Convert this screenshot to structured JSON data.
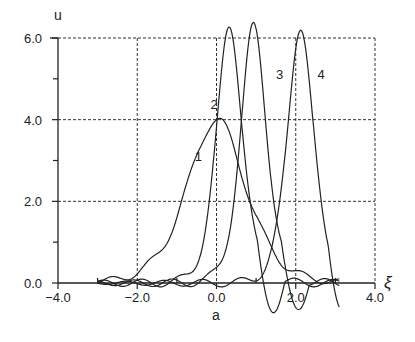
{
  "chart_data": {
    "type": "line",
    "title": "",
    "xlabel": "a",
    "xlabel_right": "ξ",
    "ylabel": "u",
    "xlim": [
      -4.0,
      4.0
    ],
    "ylim": [
      0.0,
      6.0
    ],
    "x_ticks": [
      -4.0,
      -2.0,
      0.0,
      2.0,
      4.0
    ],
    "x_tick_labels": [
      "-4.0",
      "-2.0",
      "0.0",
      "2.0",
      "4.0"
    ],
    "y_ticks": [
      0.0,
      2.0,
      4.0,
      6.0
    ],
    "y_tick_labels": [
      "0.0",
      "2.0",
      "4.0",
      "6.0"
    ],
    "grid": true,
    "grid_style": "dashed",
    "legend": "inline curve numbers",
    "series": [
      {
        "name": "1",
        "label": "1",
        "shape": "sech2",
        "amplitude": 4.0,
        "center": 0.0,
        "k": 1.02,
        "description": "broad soliton, peak u=4.0 at a=0",
        "label_pos": [
          -0.55,
          3.0
        ]
      },
      {
        "name": "2",
        "label": "2",
        "shape": "sech2",
        "amplitude": 6.3,
        "center": 0.33,
        "k": 2.3,
        "description": "narrow peak u≈6.3 at a≈0.33",
        "label_pos": [
          -0.15,
          4.25
        ]
      },
      {
        "name": "3",
        "label": "3",
        "shape": "sech2",
        "amplitude": 6.3,
        "center": 0.94,
        "k": 2.3,
        "description": "narrow peak u≈6.3 at a≈0.94",
        "label_pos": [
          1.5,
          5.0
        ]
      },
      {
        "name": "4",
        "label": "4",
        "shape": "sech2",
        "amplitude": 6.3,
        "center": 2.12,
        "k": 2.3,
        "description": "narrow peak u≈6.3 at a≈2.12",
        "label_pos": [
          2.55,
          5.0
        ]
      }
    ],
    "annotations": [
      "1",
      "2",
      "3",
      "4"
    ]
  }
}
